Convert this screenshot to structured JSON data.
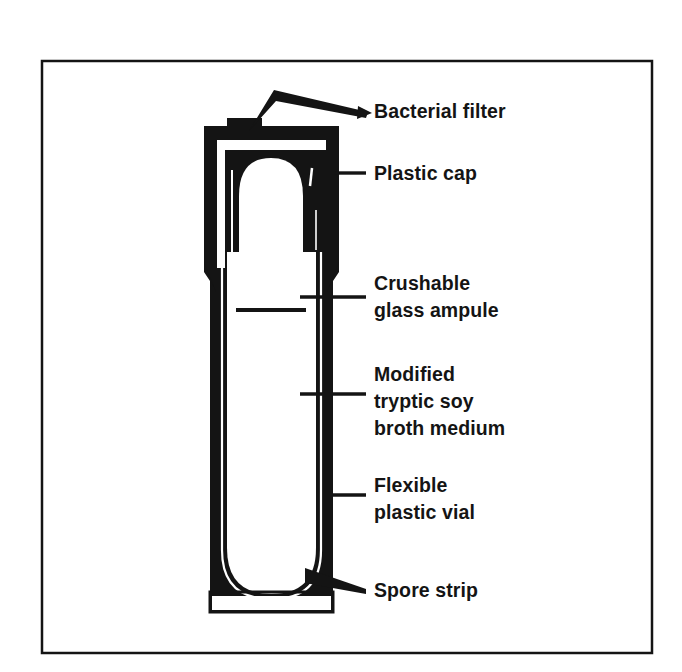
{
  "figure": {
    "background_color": "#ffffff",
    "ink_color": "#141414",
    "frame": {
      "name": "figure-border",
      "x": 42,
      "y": 61,
      "width": 610,
      "height": 592,
      "stroke_width": 2.5
    }
  },
  "callouts": [
    {
      "id": "bacterial-filter",
      "label": "Bacterial filter",
      "lines": [
        "Bacterial filter"
      ],
      "text_x": 374,
      "text_y": 118,
      "leader": "wedge-from-cap-notch-with-arrow"
    },
    {
      "id": "plastic-cap",
      "label": "Plastic cap",
      "lines": [
        "Plastic cap"
      ],
      "text_x": 374,
      "text_y": 180,
      "leader": "horizontal-tick"
    },
    {
      "id": "crushable-glass-ampule",
      "label": "Crushable glass ampule",
      "lines": [
        "Crushable",
        "glass ampule"
      ],
      "text_x": 374,
      "text_y": 290,
      "leader": "horizontal-tick"
    },
    {
      "id": "modified-tryptic-soy-broth-medium",
      "label": "Modified tryptic soy broth medium",
      "lines": [
        "Modified",
        "tryptic soy",
        "broth medium"
      ],
      "text_x": 374,
      "text_y": 381,
      "leader": "horizontal-tick"
    },
    {
      "id": "flexible-plastic-vial",
      "label": "Flexible plastic vial",
      "lines": [
        "Flexible",
        "plastic vial"
      ],
      "text_x": 374,
      "text_y": 492,
      "leader": "horizontal-tick"
    },
    {
      "id": "spore-strip",
      "label": "Spore strip",
      "lines": [
        "Spore strip"
      ],
      "text_x": 374,
      "text_y": 597,
      "leader": "wedge-from-vial-wall"
    }
  ],
  "device_parts": [
    {
      "id": "cap-body",
      "name": "Plastic cap body",
      "fill": "#141414"
    },
    {
      "id": "cap-notch",
      "name": "Bacterial filter vent notch",
      "fill": "#141414"
    },
    {
      "id": "vial-wall",
      "name": "Flexible plastic vial wall",
      "fill": "#141414"
    },
    {
      "id": "ampule",
      "name": "Crushable glass ampule",
      "fill": "#ffffff"
    },
    {
      "id": "broth-medium",
      "name": "Modified tryptic soy broth medium",
      "fill": "#ffffff"
    },
    {
      "id": "spore-strip-band",
      "name": "Spore strip",
      "fill": "#ffffff"
    }
  ]
}
